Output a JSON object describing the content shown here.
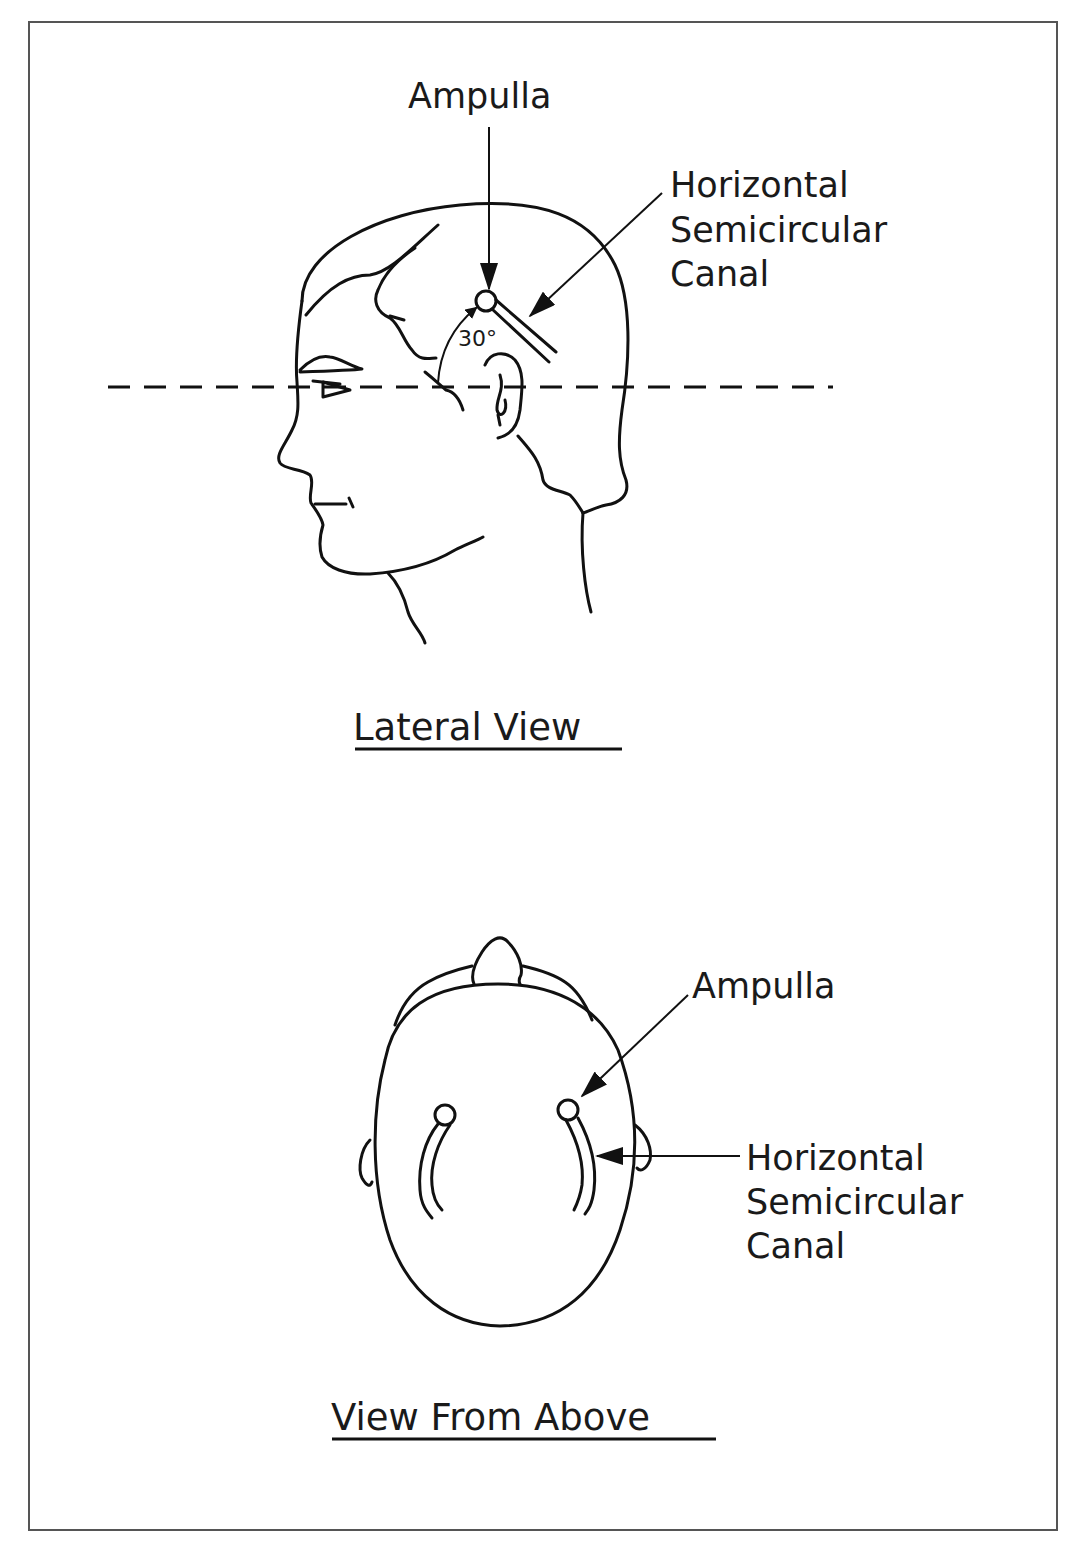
{
  "figure": {
    "lateral_view": {
      "title": "Lateral View",
      "labels": {
        "ampulla": "Ampulla",
        "canal_line1": "Horizontal",
        "canal_line2": "Semicircular",
        "canal_line3": "Canal",
        "angle": "30°"
      }
    },
    "above_view": {
      "title": "View From Above",
      "labels": {
        "ampulla": "Ampulla",
        "canal_line1": "Horizontal",
        "canal_line2": "Semicircular",
        "canal_line3": "Canal"
      }
    },
    "colors": {
      "line": "#111111",
      "frame": "#555555",
      "background": "#ffffff"
    }
  }
}
